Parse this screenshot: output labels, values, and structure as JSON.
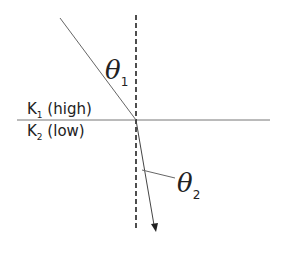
{
  "diagram": {
    "colors": {
      "line": "#555555",
      "normal": "#222222",
      "text": "#222222",
      "background": "#ffffff"
    },
    "geometry": {
      "interface": {
        "x1": 17,
        "y1": 120,
        "x2": 270,
        "y2": 120
      },
      "normal": {
        "x1": 136,
        "y1": 15,
        "x2": 136,
        "y2": 228
      },
      "incident_ray": {
        "x1": 60,
        "y1": 18,
        "x2": 136,
        "y2": 120
      },
      "refracted_ray": {
        "x1": 136,
        "y1": 120,
        "x2": 156,
        "y2": 232
      },
      "theta2_leader": {
        "x1": 142,
        "y1": 170,
        "x2": 175,
        "y2": 178
      }
    },
    "medium1": {
      "symbol": "K",
      "subscript": "1",
      "descriptor": "(high)"
    },
    "medium2": {
      "symbol": "K",
      "subscript": "2",
      "descriptor": "(low)"
    },
    "angle1": {
      "symbol": "θ",
      "subscript": "1"
    },
    "angle2": {
      "symbol": "θ",
      "subscript": "2"
    }
  }
}
